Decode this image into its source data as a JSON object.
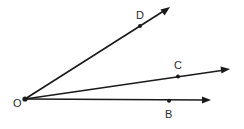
{
  "diagram": {
    "type": "geometry-angles",
    "stroke_color": "#1a1a1a",
    "vertex": {
      "label": "O",
      "x": 25,
      "y": 99,
      "label_x": 13,
      "label_y": 107
    },
    "rays": [
      {
        "name": "OD",
        "end_x": 170,
        "end_y": 7,
        "point": {
          "label": "D",
          "x": 140,
          "y": 26,
          "label_x": 136,
          "label_y": 19
        }
      },
      {
        "name": "OC",
        "end_x": 230,
        "end_y": 69,
        "point": {
          "label": "C",
          "x": 178,
          "y": 76,
          "label_x": 174,
          "label_y": 69
        }
      },
      {
        "name": "OB",
        "end_x": 211,
        "end_y": 100,
        "point": {
          "label": "B",
          "x": 169,
          "y": 101,
          "label_x": 165,
          "label_y": 118
        }
      }
    ]
  }
}
